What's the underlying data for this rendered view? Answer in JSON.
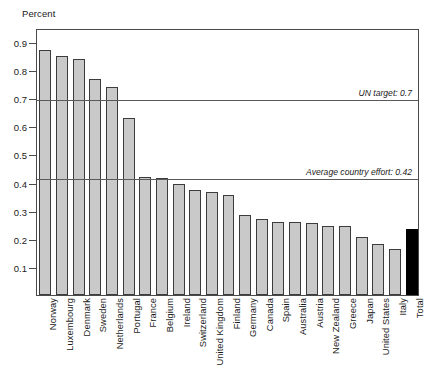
{
  "chart_data": {
    "type": "bar",
    "title": "",
    "ylabel": "Percent",
    "xlabel": "",
    "ylim": [
      0,
      0.95
    ],
    "ytick_labels": [
      "0.1",
      "0.2",
      "0.3",
      "0.4",
      "0.5",
      "0.6",
      "0.7",
      "0.8",
      "0.9"
    ],
    "ytick_values": [
      0.1,
      0.2,
      0.3,
      0.4,
      0.5,
      0.6,
      0.7,
      0.8,
      0.9
    ],
    "grid": false,
    "legend_position": "none",
    "categories": [
      "Norway",
      "Luxembourg",
      "Denmark",
      "Sweden",
      "Netherlands",
      "Portugal",
      "France",
      "Belgium",
      "Ireland",
      "Switzerland",
      "United Kingdom",
      "Finland",
      "Germany",
      "Canada",
      "Spain",
      "Australia",
      "Austria",
      "New Zealand",
      "Greece",
      "Japan",
      "United States",
      "Italy",
      "Total"
    ],
    "values": [
      0.87,
      0.85,
      0.84,
      0.77,
      0.74,
      0.63,
      0.42,
      0.415,
      0.395,
      0.375,
      0.365,
      0.355,
      0.285,
      0.27,
      0.26,
      0.26,
      0.255,
      0.245,
      0.245,
      0.205,
      0.18,
      0.165,
      0.235
    ],
    "bar_colors": [
      "#c9c9c9",
      "#c9c9c9",
      "#c9c9c9",
      "#c9c9c9",
      "#c9c9c9",
      "#c9c9c9",
      "#c9c9c9",
      "#c9c9c9",
      "#c9c9c9",
      "#c9c9c9",
      "#c9c9c9",
      "#c9c9c9",
      "#c9c9c9",
      "#c9c9c9",
      "#c9c9c9",
      "#c9c9c9",
      "#c9c9c9",
      "#c9c9c9",
      "#c9c9c9",
      "#c9c9c9",
      "#c9c9c9",
      "#c9c9c9",
      "#000000"
    ],
    "annotations": [
      {
        "label": "UN target: 0.7",
        "value": 0.7
      },
      {
        "label": "Average country effort: 0.42",
        "value": 0.42
      }
    ]
  }
}
